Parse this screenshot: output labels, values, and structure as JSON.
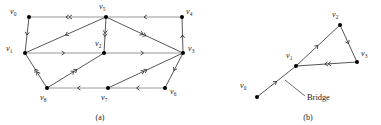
{
  "figure": {
    "panels": [
      {
        "id": "a",
        "caption": "(a)",
        "type": "directed-graph",
        "nodes": [
          {
            "id": "v0",
            "label": "v",
            "sub": "0",
            "x": 29,
            "y": 17,
            "label_x": 10,
            "label_y": 14
          },
          {
            "id": "v5",
            "label": "v",
            "sub": "5",
            "x": 106,
            "y": 17,
            "label_x": 99,
            "label_y": 9
          },
          {
            "id": "v4",
            "label": "v",
            "sub": "4",
            "x": 182,
            "y": 17,
            "label_x": 186,
            "label_y": 14
          },
          {
            "id": "v1",
            "label": "v",
            "sub": "1",
            "x": 25,
            "y": 53,
            "label_x": 6,
            "label_y": 51
          },
          {
            "id": "v2",
            "label": "v",
            "sub": "2",
            "x": 104,
            "y": 53,
            "label_x": 95,
            "label_y": 46
          },
          {
            "id": "v3",
            "label": "v",
            "sub": "3",
            "x": 183,
            "y": 53,
            "label_x": 188,
            "label_y": 51
          },
          {
            "id": "v8",
            "label": "v",
            "sub": "8",
            "x": 47,
            "y": 88,
            "label_x": 40,
            "label_y": 100
          },
          {
            "id": "v7",
            "label": "v",
            "sub": "7",
            "x": 108,
            "y": 88,
            "label_x": 101,
            "label_y": 100
          },
          {
            "id": "v6",
            "label": "v",
            "sub": "6",
            "x": 165,
            "y": 88,
            "label_x": 170,
            "label_y": 94
          }
        ],
        "edges": [
          {
            "from": "v5",
            "to": "v0",
            "arrows": 2,
            "style": "gray"
          },
          {
            "from": "v4",
            "to": "v5",
            "arrows": 1,
            "style": "gray"
          },
          {
            "from": "v0",
            "to": "v1",
            "arrows": 1,
            "style": "dark"
          },
          {
            "from": "v5",
            "to": "v1",
            "arrows": 1,
            "style": "dark"
          },
          {
            "from": "v5",
            "to": "v2",
            "arrows": 2,
            "style": "dark"
          },
          {
            "from": "v5",
            "to": "v3",
            "arrows": 2,
            "style": "dark"
          },
          {
            "from": "v1",
            "to": "v2",
            "arrows": 1,
            "style": "gray"
          },
          {
            "from": "v2",
            "to": "v3",
            "arrows": 1,
            "style": "gray"
          },
          {
            "from": "v3",
            "to": "v4",
            "arrows": 1,
            "style": "dark"
          },
          {
            "from": "v8",
            "to": "v1",
            "arrows": 2,
            "style": "dark"
          },
          {
            "from": "v8",
            "to": "v2",
            "arrows": 2,
            "style": "dark"
          },
          {
            "from": "v7",
            "to": "v8",
            "arrows": 1,
            "style": "gray"
          },
          {
            "from": "v6",
            "to": "v7",
            "arrows": 1,
            "style": "gray"
          },
          {
            "from": "v7",
            "to": "v3",
            "arrows": 2,
            "style": "dark"
          },
          {
            "from": "v3",
            "to": "v6",
            "arrows": 1,
            "style": "dark"
          }
        ]
      },
      {
        "id": "b",
        "caption": "(b)",
        "type": "directed-graph",
        "annotation": "Bridge",
        "nodes": [
          {
            "id": "v0",
            "label": "v",
            "sub": "0",
            "x": 257,
            "y": 97,
            "label_x": 240,
            "label_y": 88
          },
          {
            "id": "v1",
            "label": "v",
            "sub": "1",
            "x": 296,
            "y": 66,
            "label_x": 286,
            "label_y": 58
          },
          {
            "id": "v2",
            "label": "v",
            "sub": "2",
            "x": 340,
            "y": 25,
            "label_x": 332,
            "label_y": 17
          },
          {
            "id": "v3",
            "label": "v",
            "sub": "3",
            "x": 357,
            "y": 62,
            "label_x": 361,
            "label_y": 56
          }
        ],
        "edges": [
          {
            "from": "v0",
            "to": "v1",
            "arrows": 1,
            "style": "dark"
          },
          {
            "from": "v1",
            "to": "v2",
            "arrows": 1,
            "style": "dark"
          },
          {
            "from": "v2",
            "to": "v3",
            "arrows": 1,
            "style": "dark"
          },
          {
            "from": "v3",
            "to": "v1",
            "arrows": 2,
            "style": "dark"
          }
        ]
      }
    ],
    "captions": {
      "a": "(a)",
      "b": "(b)"
    },
    "annotations": {
      "bridge": "Bridge"
    },
    "colors": {
      "node": "#000000",
      "edge_dark": "#2b2b2b",
      "edge_gray": "#8d8d8d",
      "text": "#1a1a1a",
      "background": "#ffffff"
    }
  }
}
